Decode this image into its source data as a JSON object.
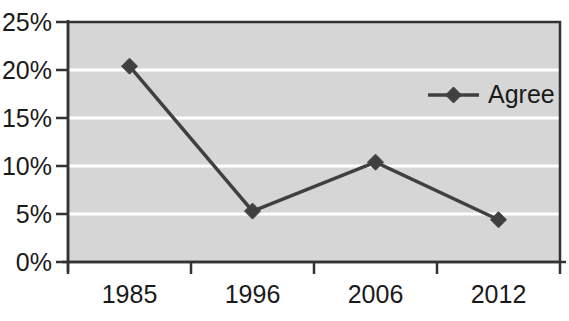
{
  "chart_data": {
    "type": "line",
    "title": "",
    "subtitle": "",
    "xlabel": "",
    "ylabel": "",
    "categories": [
      "1985",
      "1996",
      "2006",
      "2012"
    ],
    "series": [
      {
        "name": "Agree",
        "values": [
          20.4,
          5.3,
          10.4,
          4.4
        ],
        "color": "#404040",
        "marker": "diamond"
      }
    ],
    "ylim": [
      0,
      25
    ],
    "ytick_values": [
      0,
      5,
      10,
      15,
      20,
      25
    ],
    "ytick_labels": [
      "0%",
      "5%",
      "10%",
      "15%",
      "20%",
      "25%"
    ],
    "grid": {
      "horizontal": true,
      "vertical": false,
      "color": "#ffffff"
    },
    "legend": {
      "position": "upper-right-inside",
      "entries": [
        "Agree"
      ]
    },
    "plot_background": "#d6d6d6",
    "plot_border_color": "#333333",
    "axis_color": "#333333"
  },
  "axis": {
    "y_labels": [
      "25%",
      "20%",
      "15%",
      "10%",
      "5%",
      "0%"
    ],
    "x_labels": [
      "1985",
      "1996",
      "2006",
      "2012"
    ]
  },
  "legend": {
    "series_label": "Agree"
  }
}
